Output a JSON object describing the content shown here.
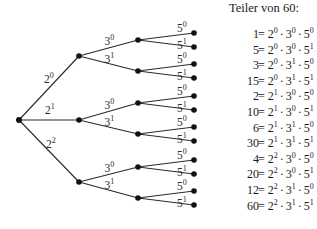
{
  "title": "Teiler von 60:",
  "tree": {
    "root": {
      "x": 19,
      "y": 120
    },
    "level1": [
      {
        "label_base": "2",
        "label_exp": "0",
        "x": 79,
        "y": 56,
        "label_x": 44,
        "label_y": 83
      },
      {
        "label_base": "2",
        "label_exp": "1",
        "x": 79,
        "y": 120,
        "label_x": 45,
        "label_y": 114
      },
      {
        "label_base": "2",
        "label_exp": "2",
        "x": 79,
        "y": 182,
        "label_x": 46,
        "label_y": 148
      }
    ],
    "level2_labels": [
      {
        "label_base": "3",
        "label_exp": "0"
      },
      {
        "label_base": "3",
        "label_exp": "1"
      }
    ],
    "level3_labels": [
      {
        "label_base": "5",
        "label_exp": "0"
      },
      {
        "label_base": "5",
        "label_exp": "1"
      }
    ],
    "level2_nodes": [
      {
        "parent": 0,
        "x": 138,
        "y": 40
      },
      {
        "parent": 0,
        "x": 138,
        "y": 71
      },
      {
        "parent": 1,
        "x": 138,
        "y": 103
      },
      {
        "parent": 1,
        "x": 138,
        "y": 134
      },
      {
        "parent": 2,
        "x": 138,
        "y": 167
      },
      {
        "parent": 2,
        "x": 138,
        "y": 198
      }
    ],
    "leaf_x": 194,
    "leaf_offsets": [
      -7,
      7
    ]
  },
  "divisors": [
    {
      "n": "1",
      "a": "0",
      "b": "0",
      "c": "0"
    },
    {
      "n": "5",
      "a": "0",
      "b": "0",
      "c": "1"
    },
    {
      "n": "3",
      "a": "0",
      "b": "1",
      "c": "0"
    },
    {
      "n": "15",
      "a": "0",
      "b": "1",
      "c": "1"
    },
    {
      "n": "2",
      "a": "1",
      "b": "0",
      "c": "0"
    },
    {
      "n": "10",
      "a": "1",
      "b": "0",
      "c": "1"
    },
    {
      "n": "6",
      "a": "1",
      "b": "1",
      "c": "0"
    },
    {
      "n": "30",
      "a": "1",
      "b": "1",
      "c": "1"
    },
    {
      "n": "4",
      "a": "2",
      "b": "0",
      "c": "0"
    },
    {
      "n": "20",
      "a": "2",
      "b": "0",
      "c": "1"
    },
    {
      "n": "12",
      "a": "2",
      "b": "1",
      "c": "0"
    },
    {
      "n": "60",
      "a": "2",
      "b": "1",
      "c": "1"
    }
  ],
  "bases": {
    "p1": "2",
    "p2": "3",
    "p3": "5"
  },
  "symbols": {
    "equals": "=",
    "times": "·"
  },
  "list_layout": {
    "eq_x": 262,
    "first_y": 27,
    "row_step": 15.6
  }
}
